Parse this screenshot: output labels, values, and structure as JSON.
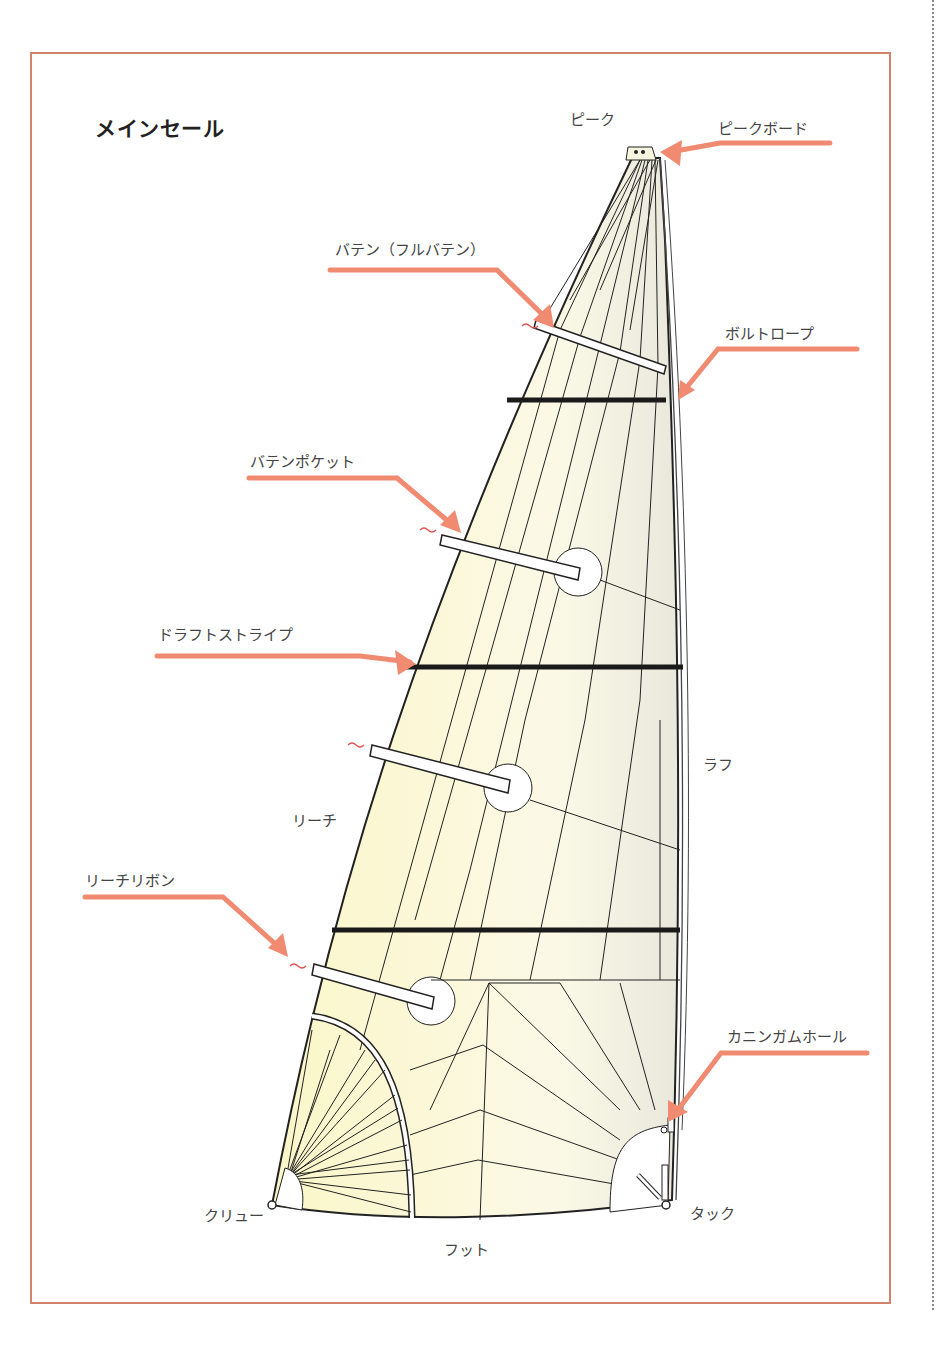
{
  "title": "メインセール",
  "labels": {
    "peak": "ピーク",
    "peak_board": "ピークボード",
    "batten_full": "バテン（フルバテン）",
    "bolt_rope": "ボルトロープ",
    "batten_pocket": "バテンポケット",
    "draft_stripe": "ドラフトストライプ",
    "luff": "ラフ",
    "leech": "リーチ",
    "leech_ribbon": "リーチリボン",
    "cunningham_hole": "カニンガムホール",
    "clew": "クリュー",
    "tack": "タック",
    "foot": "フット"
  },
  "colors": {
    "frame": "#d4826a",
    "arrow": "#f08a70",
    "sail_fill": "#fbf7d8",
    "sail_edge": "#222222",
    "stripe": "#1a1a1a"
  }
}
